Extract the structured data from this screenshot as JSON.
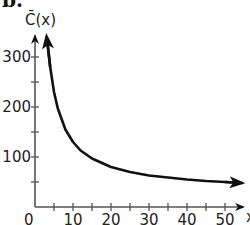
{
  "part_label": "b.",
  "chart_data": {
    "type": "line",
    "title": "",
    "ylabel": "C̄(x)",
    "xlabel": "x",
    "xlim": [
      0,
      53
    ],
    "ylim": [
      0,
      330
    ],
    "x_ticks": [
      0,
      5,
      10,
      15,
      20,
      25,
      30,
      35,
      40,
      45,
      50
    ],
    "x_tick_labels": [
      "0",
      "10",
      "20",
      "30",
      "40",
      "50"
    ],
    "y_ticks": [
      50,
      100,
      150,
      200,
      250,
      300
    ],
    "y_tick_labels": [
      "100",
      "200",
      "300"
    ],
    "grid": false,
    "series": [
      {
        "name": "C̄(x)",
        "x": [
          3.3,
          4,
          5,
          6,
          8,
          10,
          12,
          15,
          20,
          25,
          30,
          35,
          40,
          45,
          50,
          53
        ],
        "values": [
          330,
          280,
          230,
          197,
          155,
          130,
          113,
          97,
          80,
          70,
          63,
          59,
          55,
          52,
          50,
          49
        ]
      }
    ]
  }
}
